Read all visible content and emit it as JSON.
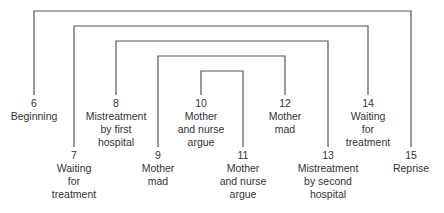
{
  "diagram": {
    "type": "nested-brackets",
    "line_color": "#555555",
    "pairs": [
      {
        "outer": "6",
        "inner": "15"
      },
      {
        "outer": "7",
        "inner": "14"
      },
      {
        "outer": "8",
        "inner": "13"
      },
      {
        "outer": "9",
        "inner": "12"
      },
      {
        "outer": "10",
        "inner": "11"
      }
    ],
    "nodes": [
      {
        "number": "6",
        "lines": [
          "Beginning"
        ]
      },
      {
        "number": "7",
        "lines": [
          "Waiting",
          "for",
          "treatment"
        ]
      },
      {
        "number": "8",
        "lines": [
          "Mistreatment",
          "by first",
          "hospital"
        ]
      },
      {
        "number": "9",
        "lines": [
          "Mother",
          "mad"
        ]
      },
      {
        "number": "10",
        "lines": [
          "Mother",
          "and nurse",
          "argue"
        ]
      },
      {
        "number": "11",
        "lines": [
          "Mother",
          "and nurse",
          "argue"
        ]
      },
      {
        "number": "12",
        "lines": [
          "Mother",
          "mad"
        ]
      },
      {
        "number": "13",
        "lines": [
          "Mistreatment",
          "by second",
          "hospital"
        ]
      },
      {
        "number": "14",
        "lines": [
          "Waiting",
          "for",
          "treatment"
        ]
      },
      {
        "number": "15",
        "lines": [
          "Reprise"
        ]
      }
    ]
  }
}
